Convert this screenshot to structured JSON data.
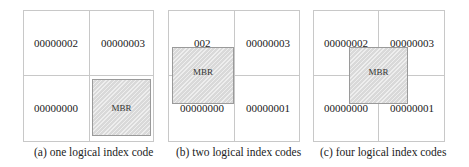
{
  "panels": [
    {
      "caption": "(a) one logical index code",
      "cells": {
        "top_left": "00000002",
        "top_right": "00000003",
        "bottom_left": "00000000",
        "bottom_right": ""
      },
      "mbr_label": "MBR"
    },
    {
      "caption": "(b) two logical index codes",
      "cells": {
        "top_left": "002",
        "top_right": "00000003",
        "bottom_left": "00000000",
        "bottom_right": "00000001"
      },
      "mbr_label": "MBR"
    },
    {
      "caption": "(c) four logical index codes",
      "cells": {
        "top_left": "00000002",
        "top_right": "00000003",
        "bottom_left": "00000000",
        "bottom_right": "00000001"
      },
      "mbr_label": "MBR"
    }
  ],
  "colors": {
    "grid_line": "#c8c8c8",
    "mbr_fill": "#d9d9d9",
    "mbr_border": "#9a9a9a"
  }
}
